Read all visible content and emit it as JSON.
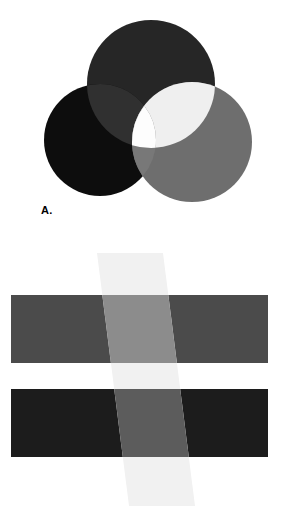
{
  "figure": {
    "background_color": "#ffffff",
    "width": 294,
    "height": 506
  },
  "panel_a": {
    "label": "A.",
    "description": "Three overlapping discs arranged in a triad; overlaps become progressively lighter and the common central region is white.",
    "circles": [
      {
        "name": "top-circle",
        "cx": 151,
        "cy": 84,
        "r": 64,
        "fill": "#262626",
        "label": "top disc"
      },
      {
        "name": "left-circle",
        "cx": 100,
        "cy": 140,
        "r": 56,
        "fill": "#0d0d0d",
        "label": "left disc"
      },
      {
        "name": "right-circle",
        "cx": 192,
        "cy": 142,
        "r": 60,
        "fill": "#6e6e6e",
        "label": "right disc"
      }
    ],
    "overlaps": [
      {
        "name": "top-left-overlap",
        "fill": "#303030"
      },
      {
        "name": "top-right-overlap",
        "fill": "#efefef"
      },
      {
        "name": "left-right-overlap",
        "fill": "#787878"
      },
      {
        "name": "center-triple-overlap",
        "fill": "#fdfdfd"
      }
    ]
  },
  "panel_b": {
    "label": "B.",
    "description": "Two horizontal bars of different lightness crossed by a translucent light diagonal band.",
    "bars": [
      {
        "name": "upper-bar",
        "x": 11,
        "y": 42,
        "width": 257,
        "height": 68,
        "fill": "#4b4b4b",
        "label": "upper bar (mid gray)"
      },
      {
        "name": "lower-bar",
        "x": 11,
        "y": 136,
        "width": 257,
        "height": 68,
        "fill": "#1c1c1c",
        "label": "lower bar (dark gray)"
      }
    ],
    "band": {
      "name": "diagonal-band",
      "label": "translucent diagonal band",
      "points": "97,0 163,0 195,253 129,253",
      "fill_over_white": "#f1f1f1",
      "fill_over_upper_bar": "#8c8c8c",
      "fill_over_lower_bar": "#5c5c5c"
    }
  }
}
